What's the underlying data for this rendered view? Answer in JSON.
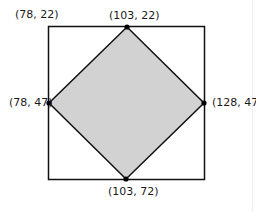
{
  "diagram": {
    "type": "geometry",
    "colors": {
      "stroke": "#111111",
      "diamond_fill": "#d2d2d2",
      "background": "#ffffff"
    },
    "outer_square": {
      "corner_label": "(78, 22)"
    },
    "diamond_vertices": [
      {
        "name": "top",
        "label": "(103, 22)"
      },
      {
        "name": "right",
        "label": "(128, 47)"
      },
      {
        "name": "bottom",
        "label": "(103, 72)"
      },
      {
        "name": "left",
        "label": "(78, 47)"
      }
    ]
  }
}
